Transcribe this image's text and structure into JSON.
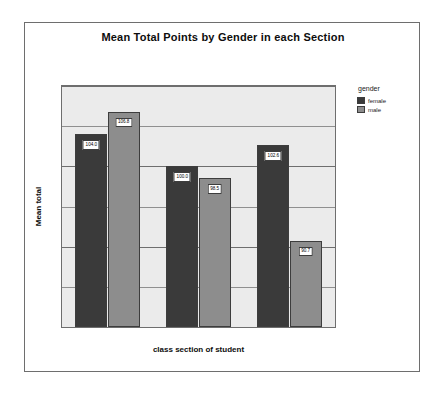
{
  "chart_data": {
    "type": "bar",
    "title": "Mean Total Points by Gender in each Section",
    "xlabel": "class section of student",
    "ylabel": "Mean total",
    "categories": [
      "1",
      "2",
      "3"
    ],
    "series": [
      {
        "name": "female",
        "color": "#3a3a3a",
        "values": [
          104.0,
          100.0,
          102.6
        ],
        "labels": [
          "104.0",
          "100.0",
          "102.6"
        ]
      },
      {
        "name": "male",
        "color": "#8d8d8d",
        "values": [
          106.8,
          98.5,
          90.7
        ],
        "labels": [
          "106.8",
          "98.5",
          "90.7"
        ]
      }
    ],
    "ylim": [
      80,
      110
    ],
    "y_ticks": [
      "80",
      "90",
      "100",
      "110"
    ],
    "y_tick_values": [
      80,
      90,
      100,
      110
    ],
    "gridline_values": [
      85,
      90,
      95,
      100,
      105,
      110
    ],
    "grid": true,
    "legend_title": "gender",
    "legend_position": "right"
  }
}
